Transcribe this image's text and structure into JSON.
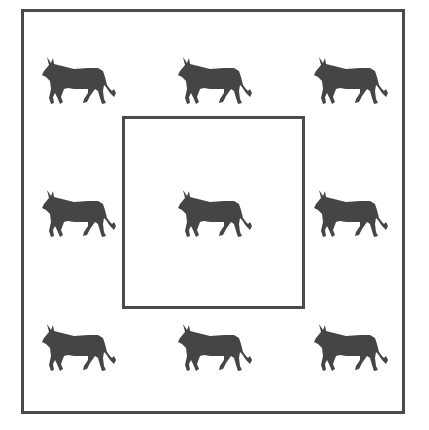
{
  "figure": {
    "colors": {
      "stroke": "#4a4a4a",
      "bull_fill": "#454545",
      "background": "#ffffff"
    },
    "outer_box": {
      "label": "outer-square"
    },
    "inner_box": {
      "label": "inner-square",
      "bull_count": 1
    },
    "bulls": [
      {
        "id": "top-left",
        "x": 40,
        "y": 53,
        "region": "outside"
      },
      {
        "id": "top-center",
        "x": 176,
        "y": 53,
        "region": "outside"
      },
      {
        "id": "top-right",
        "x": 312,
        "y": 53,
        "region": "outside"
      },
      {
        "id": "middle-left",
        "x": 40,
        "y": 186,
        "region": "outside"
      },
      {
        "id": "center",
        "x": 176,
        "y": 186,
        "region": "inside"
      },
      {
        "id": "middle-right",
        "x": 312,
        "y": 186,
        "region": "outside"
      },
      {
        "id": "bottom-left",
        "x": 40,
        "y": 320,
        "region": "outside"
      },
      {
        "id": "bottom-center",
        "x": 176,
        "y": 320,
        "region": "outside"
      },
      {
        "id": "bottom-right",
        "x": 312,
        "y": 320,
        "region": "outside"
      }
    ],
    "counts": {
      "total": 9,
      "inside": 1,
      "outside": 8
    }
  }
}
